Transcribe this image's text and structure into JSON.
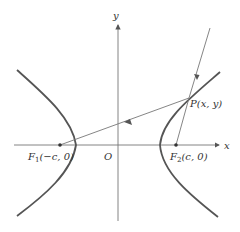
{
  "diagram": {
    "type": "hyperbola-reflection",
    "axes": {
      "x_label": "x",
      "y_label": "y",
      "origin_label": "O"
    },
    "foci": [
      {
        "name": "F1",
        "label_main": "F",
        "label_sub": "1",
        "label_coords": "(−c,  0)",
        "x": 60,
        "y": 145
      },
      {
        "name": "F2",
        "label_main": "F",
        "label_sub": "2",
        "label_coords": "(c,  0)",
        "x": 176,
        "y": 145
      }
    ],
    "point": {
      "label": "P(x,  y)",
      "x": 189,
      "y": 98
    },
    "colors": {
      "curve": "#555555",
      "axis": "#777777",
      "text": "#333333"
    }
  }
}
